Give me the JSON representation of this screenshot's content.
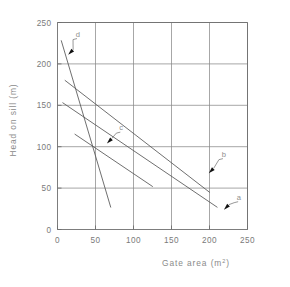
{
  "chart_data": {
    "type": "line",
    "title": "",
    "xlabel": "Gate area  (m²)",
    "ylabel": "Head on sill  (m)",
    "xlim": [
      0,
      250
    ],
    "ylim": [
      0,
      250
    ],
    "xticks": [
      0,
      50,
      100,
      150,
      200,
      250
    ],
    "yticks": [
      0,
      50,
      100,
      150,
      200,
      250
    ],
    "xtick_labels": [
      "0",
      "50",
      "100",
      "150",
      "200",
      "250"
    ],
    "ytick_labels": [
      "0",
      "50",
      "100",
      "150",
      "200",
      "250"
    ],
    "grid": true,
    "legend": "none",
    "annotations": [
      {
        "label": "d",
        "text_x": 27,
        "text_y": 233,
        "arrow_tip_x": 14,
        "arrow_tip_y": 211
      },
      {
        "label": "c",
        "text_x": 84,
        "text_y": 120,
        "arrow_tip_x": 65,
        "arrow_tip_y": 104
      },
      {
        "label": "b",
        "text_x": 219,
        "text_y": 88,
        "arrow_tip_x": 199,
        "arrow_tip_y": 68
      },
      {
        "label": "a",
        "text_x": 239,
        "text_y": 36,
        "arrow_tip_x": 219,
        "arrow_tip_y": 24
      }
    ],
    "series": [
      {
        "name": "d",
        "comment": "steepest near-vertical line",
        "points": [
          [
            5,
            228
          ],
          [
            70,
            27
          ]
        ]
      },
      {
        "name": "c",
        "comment": "short middle line",
        "points": [
          [
            23,
            115
          ],
          [
            125,
            52
          ]
        ]
      },
      {
        "name": "b",
        "comment": "lower long line ending near x=210",
        "points": [
          [
            7,
            153
          ],
          [
            210,
            27
          ]
        ]
      },
      {
        "name": "a",
        "comment": "upper long line ending near x=200",
        "points": [
          [
            10,
            180
          ],
          [
            200,
            45
          ]
        ]
      }
    ]
  },
  "axes": {
    "x_axis_label": "Gate area  (m²)",
    "x_axis_label_base": "Gate area  (m",
    "x_axis_label_sup": "2",
    "x_axis_label_tail": ")",
    "y_axis_label": "Head on sill  (m)"
  },
  "labels": {
    "curve_d": "d",
    "curve_c": "c",
    "curve_b": "b",
    "curve_a": "a"
  },
  "colors": {
    "line": "#555555",
    "grid": "#8a8a8a",
    "axis": "#6e6e6e",
    "tick_text": "#7a7a7a",
    "background": "#ffffff"
  }
}
